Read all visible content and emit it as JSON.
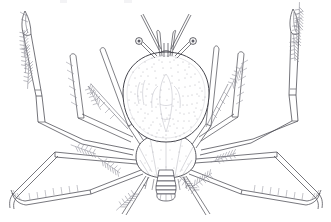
{
  "figure": {
    "domain": "natural-image",
    "caption": "",
    "background_color": "#ffffff",
    "ink_color": "#3a3a42",
    "stipple_color": "#7b7b86",
    "faint_color": "#b9b9c2",
    "width": 331,
    "height": 222
  },
  "anatomy": {
    "carapace": {
      "label": "carapace",
      "center_x": 166,
      "center_y": 97,
      "half_width": 43,
      "half_height": 45,
      "texture": "stippled",
      "stipple_count": 760
    },
    "abdomen": {
      "label": "abdomen",
      "center_x": 166,
      "center_y": 156,
      "half_width": 30,
      "half_height": 22
    },
    "pleon": {
      "label": "pleon-telson",
      "segments": 6,
      "top_y": 170,
      "bottom_y": 199,
      "center_x": 166
    },
    "eyes": {
      "label": "stalked-eyes",
      "count": 2,
      "left": {
        "x": 139,
        "y": 42,
        "r": 3.4
      },
      "right": {
        "x": 193,
        "y": 42,
        "r": 3.4
      }
    },
    "antennae": {
      "label": "antennae",
      "count": 4
    },
    "chelipeds": {
      "label": "chelipeds",
      "count": 2,
      "left_tip": {
        "x": 27,
        "y": 12
      },
      "right_tip": {
        "x": 293,
        "y": 10
      }
    },
    "walking_legs": {
      "label": "walking-legs",
      "pairs": 4,
      "setae_tufts": 10
    }
  },
  "top_artifacts": [
    {
      "left": 60,
      "width": 7
    },
    {
      "left": 124,
      "width": 8
    }
  ]
}
